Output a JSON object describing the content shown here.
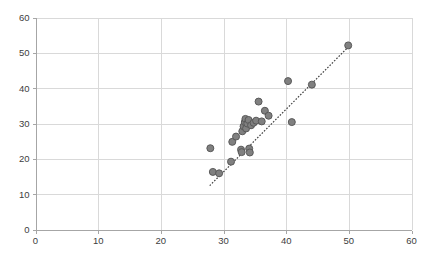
{
  "chart_data": {
    "type": "scatter",
    "title": "",
    "subtitle": "",
    "xlabel": "",
    "ylabel": "",
    "xlim": [
      0,
      60
    ],
    "ylim": [
      0,
      60
    ],
    "xticks": [
      0,
      10,
      20,
      30,
      40,
      50,
      60
    ],
    "yticks": [
      0,
      10,
      20,
      30,
      40,
      50,
      60
    ],
    "xtick_labels": [
      "0",
      "10",
      "20",
      "30",
      "40",
      "50",
      "60"
    ],
    "ytick_labels": [
      "0",
      "10",
      "20",
      "30",
      "40",
      "50",
      "60"
    ],
    "grid": true,
    "grid_axes": "both",
    "legend": false,
    "legend_position": "none",
    "marker": {
      "shape": "circle",
      "size": 7,
      "fill": "#808080",
      "stroke": "#595959"
    },
    "series": [
      {
        "name": "data",
        "points": [
          [
            27.9,
            23.0
          ],
          [
            28.3,
            16.3
          ],
          [
            29.3,
            15.9
          ],
          [
            31.2,
            19.2
          ],
          [
            31.4,
            24.8
          ],
          [
            32.0,
            26.3
          ],
          [
            32.8,
            22.6
          ],
          [
            32.9,
            21.9
          ],
          [
            33.0,
            27.8
          ],
          [
            33.2,
            29.2
          ],
          [
            33.4,
            30.4
          ],
          [
            33.5,
            31.3
          ],
          [
            33.6,
            28.6
          ],
          [
            33.8,
            30.0
          ],
          [
            34.0,
            31.0
          ],
          [
            34.1,
            22.9
          ],
          [
            34.2,
            21.8
          ],
          [
            34.4,
            29.5
          ],
          [
            34.8,
            30.2
          ],
          [
            35.2,
            30.8
          ],
          [
            35.6,
            36.2
          ],
          [
            36.1,
            30.6
          ],
          [
            36.6,
            33.6
          ],
          [
            37.2,
            32.2
          ],
          [
            40.3,
            42.0
          ],
          [
            40.9,
            30.4
          ],
          [
            44.1,
            41.0
          ],
          [
            49.9,
            52.1
          ]
        ]
      }
    ],
    "trendline": {
      "visible": true,
      "style": "dotted",
      "color": "#404040",
      "x0": 27.8,
      "y0": 12.4,
      "x1": 50.0,
      "y1": 51.8
    }
  }
}
